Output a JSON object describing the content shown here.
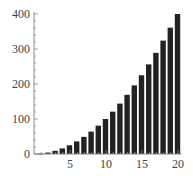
{
  "chart_data": {
    "type": "bar",
    "title": "",
    "xlabel": "",
    "ylabel": "",
    "categories": [
      1,
      2,
      3,
      4,
      5,
      6,
      7,
      8,
      9,
      10,
      11,
      12,
      13,
      14,
      15,
      16,
      17,
      18,
      19,
      20
    ],
    "values": [
      1,
      4,
      9,
      16,
      25,
      36,
      49,
      64,
      81,
      100,
      121,
      144,
      169,
      196,
      225,
      256,
      289,
      324,
      361,
      400
    ],
    "xlim": [
      0,
      20.5
    ],
    "ylim": [
      0,
      400
    ],
    "x_ticks": [
      5,
      10,
      15,
      20
    ],
    "y_ticks": [
      0,
      100,
      200,
      300,
      400
    ],
    "grid": false,
    "legend": null,
    "bar_color": "#222222",
    "axis_color": "#888888"
  }
}
